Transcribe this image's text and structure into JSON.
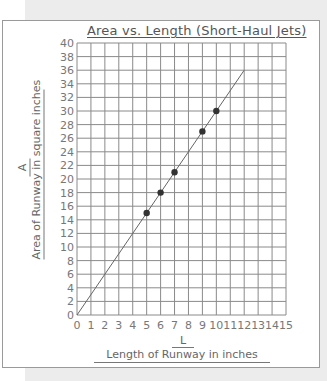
{
  "chart_data": {
    "type": "scatter",
    "title": "Area vs. Length (Short-Haul Jets)",
    "xlabel": "Length of Runway in inches",
    "xvar": "L",
    "ylabel": "Area of Runway in square inches",
    "yvar": "A",
    "xlim": [
      0,
      15
    ],
    "ylim": [
      0,
      40
    ],
    "xticks": [
      0,
      1,
      2,
      3,
      4,
      5,
      6,
      7,
      8,
      9,
      10,
      11,
      12,
      13,
      14,
      15
    ],
    "yticks": [
      0,
      2,
      4,
      6,
      8,
      10,
      12,
      14,
      16,
      18,
      20,
      22,
      24,
      26,
      28,
      30,
      32,
      34,
      36,
      38,
      40
    ],
    "grid": true,
    "points": [
      {
        "x": 5,
        "y": 15
      },
      {
        "x": 6,
        "y": 18
      },
      {
        "x": 7,
        "y": 21
      },
      {
        "x": 9,
        "y": 27
      },
      {
        "x": 10,
        "y": 30
      }
    ],
    "line": {
      "from": [
        0,
        0
      ],
      "to": [
        12,
        36
      ],
      "relation": "A = 3L"
    },
    "colors": {
      "grid": "#8a8a8a",
      "points": "#333333",
      "line": "#666666",
      "text": "#666666"
    }
  }
}
